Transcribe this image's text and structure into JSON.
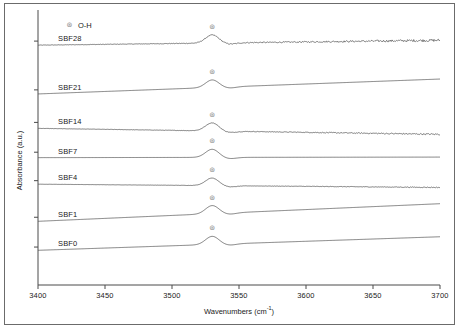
{
  "chart_data": {
    "type": "line",
    "title": "",
    "xlabel": "Wavenumbers (cm-1)",
    "xlabel_base": "Wavenumbers (cm",
    "xlabel_sup": "-1",
    "xlabel_close": ")",
    "ylabel": "Absorbance (a.u.)",
    "xlim": [
      3400,
      3700
    ],
    "xticks": [
      3400,
      3450,
      3500,
      3550,
      3600,
      3650,
      3700
    ],
    "xticklabels": [
      "3400",
      "3450",
      "3500",
      "3550",
      "3600",
      "3650",
      "3700"
    ],
    "yticks_labeled": false,
    "ylim": [
      0,
      1
    ],
    "grid": false,
    "legend": {
      "position": "top-left-inside",
      "entries": [
        {
          "marker": "circle-marker-icon",
          "glyph": "⊛",
          "label": "O-H",
          "color": "#8a8a8a"
        }
      ]
    },
    "peak_annotation_wavenumber": 3530,
    "line_color": "#555555",
    "series": [
      {
        "name": "SBF28",
        "label": "SBF28",
        "label_x": 3415,
        "baseline_offset": 0.885,
        "slope": 0.018,
        "peak_height": 0.03,
        "noise": 0.006,
        "marker_glyph": "⊛"
      },
      {
        "name": "SBF21",
        "label": "SBF21",
        "label_x": 3415,
        "baseline_offset": 0.705,
        "slope": 0.055,
        "peak_height": 0.028,
        "noise": 0.0,
        "marker_glyph": "⊛"
      },
      {
        "name": "SBF14",
        "label": "SBF14",
        "label_x": 3415,
        "baseline_offset": 0.578,
        "slope": -0.022,
        "peak_height": 0.03,
        "noise": 0.0035,
        "marker_glyph": "⊛"
      },
      {
        "name": "SBF7",
        "label": "SBF7",
        "label_x": 3415,
        "baseline_offset": 0.47,
        "slope": 0.002,
        "peak_height": 0.03,
        "noise": 0.0,
        "marker_glyph": "⊛"
      },
      {
        "name": "SBF4",
        "label": "SBF4",
        "label_x": 3415,
        "baseline_offset": 0.372,
        "slope": -0.012,
        "peak_height": 0.028,
        "noise": 0.002,
        "marker_glyph": "⊛"
      },
      {
        "name": "SBF1",
        "label": "SBF1",
        "label_x": 3415,
        "baseline_offset": 0.235,
        "slope": 0.065,
        "peak_height": 0.03,
        "noise": 0.0,
        "marker_glyph": "⊛"
      },
      {
        "name": "SBF0",
        "label": "SBF0",
        "label_x": 3415,
        "baseline_offset": 0.128,
        "slope": 0.05,
        "peak_height": 0.03,
        "noise": 0.0,
        "marker_glyph": "⊛"
      }
    ]
  }
}
